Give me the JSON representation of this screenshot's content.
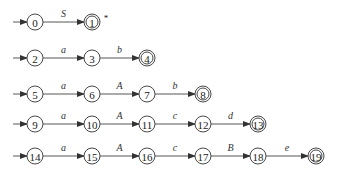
{
  "diagram": {
    "type": "state-automata",
    "rows": [
      {
        "states": [
          "0",
          "1"
        ],
        "labels": [
          "S"
        ],
        "final": "1",
        "annotation": "*"
      },
      {
        "states": [
          "2",
          "3",
          "4"
        ],
        "labels": [
          "a",
          "b"
        ],
        "final": "4"
      },
      {
        "states": [
          "5",
          "6",
          "7",
          "8"
        ],
        "labels": [
          "a",
          "A",
          "b"
        ],
        "final": "8"
      },
      {
        "states": [
          "9",
          "10",
          "11",
          "12",
          "13"
        ],
        "labels": [
          "a",
          "A",
          "c",
          "d"
        ],
        "final": "13"
      },
      {
        "states": [
          "14",
          "15",
          "16",
          "17",
          "18",
          "19"
        ],
        "labels": [
          "a",
          "A",
          "c",
          "B",
          "e"
        ],
        "final": "19"
      }
    ]
  }
}
